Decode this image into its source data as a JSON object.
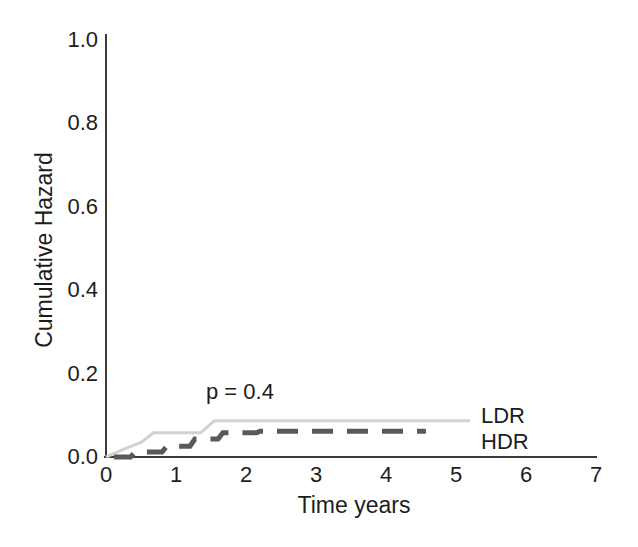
{
  "chart_data": {
    "type": "line",
    "subtype": "cumulative-hazard-step-curves",
    "title": "",
    "xlabel": "Time years",
    "ylabel": "Cumulative Hazard",
    "xlim": [
      0,
      7
    ],
    "ylim": [
      0,
      1.0
    ],
    "xticks": [
      "0",
      "1",
      "2",
      "3",
      "4",
      "5",
      "6",
      "7"
    ],
    "yticks": [
      "0.0",
      "0.2",
      "0.4",
      "0.6",
      "0.8",
      "1.0"
    ],
    "grid": false,
    "annotation": "p = 0.4",
    "series": [
      {
        "name": "LDR",
        "line_style": "solid",
        "color": "#cfd1d2",
        "points": [
          [
            0,
            0
          ],
          [
            0.07,
            0.005
          ],
          [
            0.3,
            0.022
          ],
          [
            0.5,
            0.035
          ],
          [
            0.68,
            0.058
          ],
          [
            1.35,
            0.058
          ],
          [
            1.55,
            0.087
          ],
          [
            5.2,
            0.087
          ]
        ]
      },
      {
        "name": "HDR",
        "line_style": "dashed",
        "color": "#58595b",
        "points": [
          [
            0,
            0
          ],
          [
            0.35,
            0
          ],
          [
            0.42,
            0.012
          ],
          [
            0.8,
            0.012
          ],
          [
            0.87,
            0.026
          ],
          [
            1.2,
            0.026
          ],
          [
            1.27,
            0.043
          ],
          [
            1.6,
            0.043
          ],
          [
            1.67,
            0.058
          ],
          [
            2.15,
            0.058
          ],
          [
            2.2,
            0.062
          ],
          [
            4.57,
            0.062
          ]
        ]
      }
    ]
  },
  "colors": {
    "background": "#ffffff",
    "axis": "#3a3a3a",
    "text": "#1d1d1d",
    "ldr_line": "#cfd1d2",
    "hdr_line": "#58595b"
  }
}
